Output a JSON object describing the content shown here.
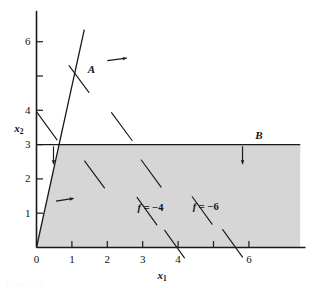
{
  "figure": {
    "background_color": "#ffffff",
    "ink_color": "#1a1a1a",
    "shade_color": "#d6d6d6",
    "caption_partial": "Figure 2.1"
  },
  "axes": {
    "x_title": "x",
    "x_subscript": "1",
    "y_title": "x",
    "y_subscript": "2",
    "x_ticks": [
      {
        "value": 0,
        "label": "0"
      },
      {
        "value": 1,
        "label": "1"
      },
      {
        "value": 2,
        "label": "2"
      },
      {
        "value": 3,
        "label": "3"
      },
      {
        "value": 4,
        "label": "4"
      },
      {
        "value": 5,
        "label": ""
      },
      {
        "value": 6,
        "label": "6"
      }
    ],
    "y_ticks": [
      {
        "value": 0,
        "label": ""
      },
      {
        "value": 1,
        "label": "1"
      },
      {
        "value": 2,
        "label": "2"
      },
      {
        "value": 3,
        "label": "3"
      },
      {
        "value": 4,
        "label": "4"
      },
      {
        "value": 5,
        "label": ""
      },
      {
        "value": 6,
        "label": "6"
      }
    ],
    "x_range": [
      0,
      7.6
    ],
    "y_range": [
      0,
      6.9
    ]
  },
  "constraints": [
    {
      "name": "A",
      "label": "A",
      "label_x": 1.55,
      "label_y": 5.35,
      "type": "line",
      "from": [
        0.0,
        0.0
      ],
      "to": [
        1.35,
        6.35
      ],
      "feasible_arrows": [
        {
          "x": 2.0,
          "y": 5.45,
          "dx": 0.55,
          "dy": 0.07
        },
        {
          "x": 0.55,
          "y": 1.35,
          "dx": 0.5,
          "dy": 0.08
        }
      ]
    },
    {
      "name": "B",
      "label": "B",
      "label_x": 6.28,
      "label_y": 3.42,
      "type": "line",
      "from": [
        0.0,
        3.0
      ],
      "to": [
        7.45,
        3.0
      ],
      "feasible_arrows": [
        {
          "x": 0.48,
          "y": 2.95,
          "dx": 0.0,
          "dy": -0.52
        },
        {
          "x": 5.82,
          "y": 2.95,
          "dx": 0.0,
          "dy": -0.52
        }
      ]
    }
  ],
  "feasible_region": {
    "label": "shaded feasible set",
    "vertices": [
      [
        0,
        0
      ],
      [
        0.638,
        3.0
      ],
      [
        7.45,
        3.0
      ],
      [
        7.45,
        0
      ]
    ]
  },
  "contour_labels": [
    {
      "text_prefix": "f",
      "text_rest": " = −4",
      "x": 3.22,
      "y": 1.3
    },
    {
      "text_prefix": "f",
      "text_rest": " = −6",
      "x": 4.78,
      "y": 1.34
    }
  ],
  "contour_lines": [
    {
      "from": [
        0.92,
        5.3
      ],
      "to": [
        1.48,
        4.52
      ]
    },
    {
      "from": [
        2.12,
        3.93
      ],
      "to": [
        2.7,
        3.12
      ]
    },
    {
      "from": [
        0.02,
        3.93
      ],
      "to": [
        0.58,
        3.14
      ]
    },
    {
      "from": [
        1.36,
        2.52
      ],
      "to": [
        1.92,
        1.74
      ]
    },
    {
      "from": [
        2.96,
        2.55
      ],
      "to": [
        3.52,
        1.76
      ]
    },
    {
      "from": [
        2.84,
        1.46
      ],
      "to": [
        3.4,
        0.66
      ]
    },
    {
      "from": [
        4.4,
        1.48
      ],
      "to": [
        4.96,
        0.68
      ]
    },
    {
      "from": [
        3.62,
        0.5
      ],
      "to": [
        4.18,
        -0.3
      ]
    },
    {
      "from": [
        5.26,
        0.52
      ],
      "to": [
        5.82,
        -0.28
      ]
    }
  ]
}
